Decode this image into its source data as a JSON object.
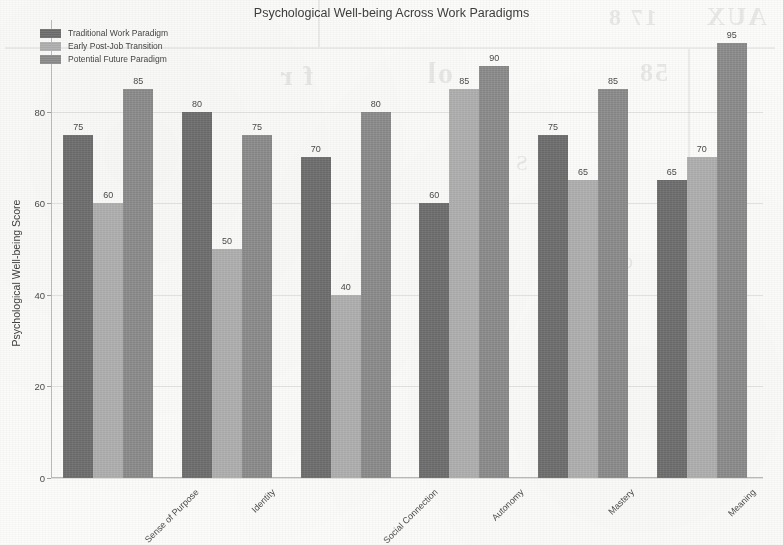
{
  "chart_data": {
    "type": "bar",
    "title": "Psychological Well-being Across Work Paradigms",
    "xlabel": "",
    "ylabel": "Psychological Well-being Score",
    "categories": [
      "Sense of Purpose",
      "Identity",
      "Social Connection",
      "Autonomy",
      "Mastery",
      "Meaning"
    ],
    "series": [
      {
        "name": "Traditional Work Paradigm",
        "color": "#6f6f6f",
        "values": [
          75,
          80,
          70,
          60,
          75,
          65
        ]
      },
      {
        "name": "Early Post-Job Transition",
        "color": "#adadad",
        "values": [
          60,
          50,
          40,
          85,
          65,
          70
        ]
      },
      {
        "name": "Potential Future Paradigm",
        "color": "#8b8b8b",
        "values": [
          85,
          75,
          80,
          90,
          85,
          95
        ]
      }
    ],
    "ylim": [
      0,
      100
    ],
    "yticks": [
      0,
      20,
      40,
      60,
      80
    ],
    "ytick_labels": [
      "0",
      "20",
      "40",
      "60",
      "80"
    ],
    "grid": true,
    "grid_axis": "y",
    "legend_position": "upper left",
    "bar_labels": true,
    "xtick_rotation": -45
  },
  "background_artifacts": {
    "note": "faint mirrored bleed-through text from reverse side of scanned page",
    "lines": [
      "AUX",
      "58",
      "ol"
    ]
  }
}
